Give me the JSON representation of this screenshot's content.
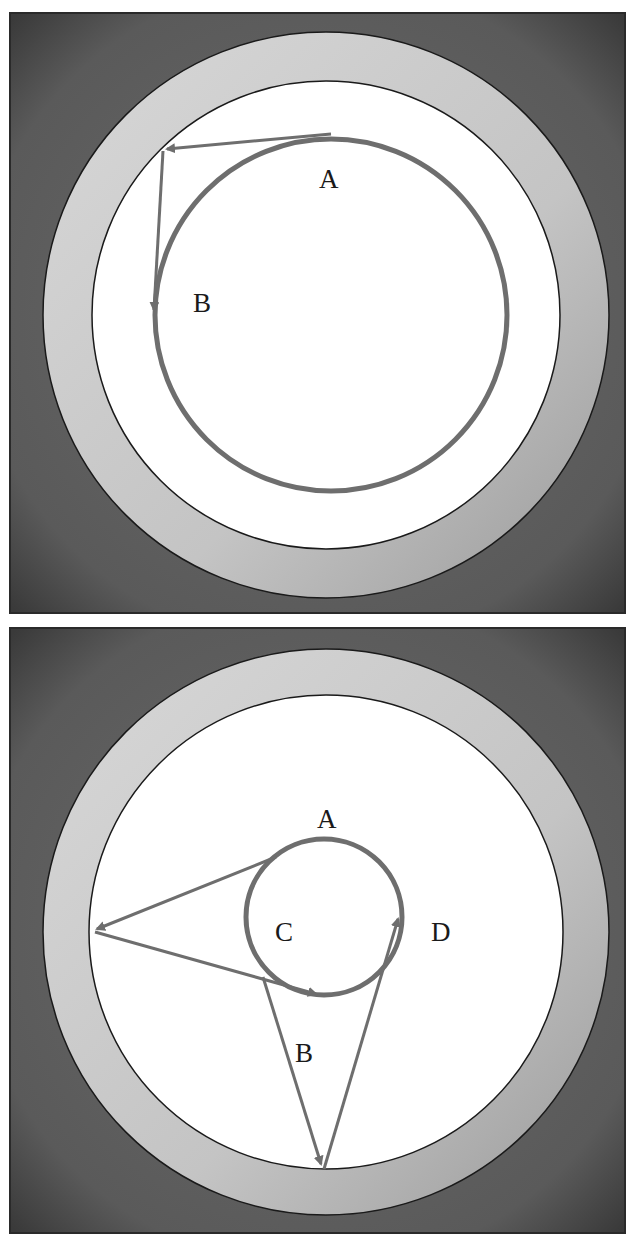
{
  "colors": {
    "frame": "#555555",
    "ring": "#c4c4c4",
    "interior": "#ffffff",
    "path": "#6e6e6e",
    "outline": "#1a1a1a"
  },
  "panels": [
    {
      "id": "top",
      "labels": {
        "A": "A",
        "B": "B"
      }
    },
    {
      "id": "bottom",
      "labels": {
        "A": "A",
        "B": "B",
        "C": "C",
        "D": "D"
      }
    }
  ]
}
